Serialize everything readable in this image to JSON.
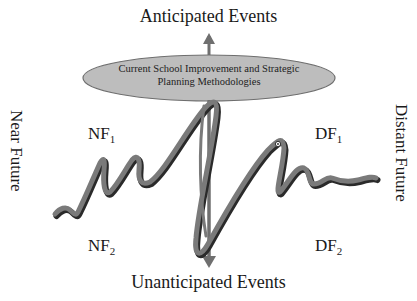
{
  "diagram": {
    "top_label": "Anticipated Events",
    "bottom_label": "Unanticipated Events",
    "left_label": "Near Future",
    "right_label": "Distant Future",
    "ellipse_label_line1": "Current School Improvement and Strategic",
    "ellipse_label_line2": "Planning Methodologies",
    "quadrants": {
      "nf1": {
        "base": "NF",
        "sub": "1"
      },
      "df1": {
        "base": "DF",
        "sub": "1"
      },
      "nf2": {
        "base": "NF",
        "sub": "2"
      },
      "df2": {
        "base": "DF",
        "sub": "2"
      }
    },
    "colors": {
      "ellipse_fill": "#bdbdbd",
      "ellipse_stroke": "#6e6e6e",
      "arrow": "#6f6f6f",
      "wave_fill": "#7a7a7a",
      "wave_shadow": "#2a2a2a",
      "text": "#1a1a1a"
    }
  }
}
